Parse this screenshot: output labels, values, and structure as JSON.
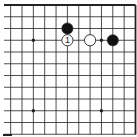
{
  "diagram": {
    "type": "go-board-fragment",
    "board_size": 19,
    "visible_columns": [
      8,
      19
    ],
    "visible_rows": [
      1,
      12
    ],
    "edges_shown": [
      "top",
      "right"
    ],
    "colors": {
      "background": "#ffffff",
      "line": "#222222",
      "black_stone": "#111111",
      "white_stone": "#ffffff",
      "stone_outline": "#222222",
      "label": "#222222"
    },
    "star_points": [
      {
        "col": 10,
        "row": 4
      },
      {
        "col": 16,
        "row": 4
      },
      {
        "col": 10,
        "row": 10
      },
      {
        "col": 16,
        "row": 10
      }
    ],
    "stones": [
      {
        "color": "black",
        "col": 13,
        "row": 3,
        "label": ""
      },
      {
        "color": "white",
        "col": 13,
        "row": 4,
        "label": "1"
      },
      {
        "color": "white",
        "col": 15,
        "row": 4,
        "label": ""
      },
      {
        "color": "black",
        "col": 17,
        "row": 4,
        "label": ""
      }
    ]
  }
}
